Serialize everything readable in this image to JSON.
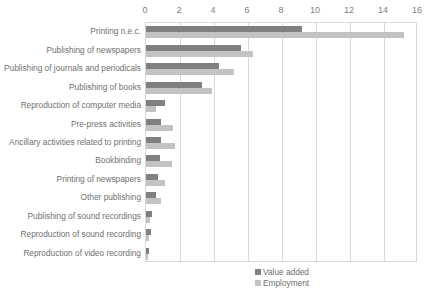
{
  "clipped_header_text": "",
  "legend": {
    "position": "bottom-center",
    "items": [
      {
        "label": "Value added",
        "color": "#808080"
      },
      {
        "label": "Employment",
        "color": "#c3c3c3"
      }
    ]
  },
  "chart_data": {
    "type": "bar",
    "orientation": "horizontal",
    "title": "",
    "subtitle": "",
    "xlabel": "",
    "ylabel": "",
    "xlim": [
      0,
      16
    ],
    "xticks": [
      0,
      2,
      4,
      6,
      8,
      10,
      12,
      14,
      16
    ],
    "xtick_labels": [
      "0",
      "2",
      "4",
      "6",
      "8",
      "10",
      "12",
      "14",
      "16"
    ],
    "grid": "vertical",
    "axis_label_position": "top",
    "categories": [
      "Printing n.e.c.",
      "Publishing of newspapers",
      "Publishing of journals and periodicals",
      "Publishing of books",
      "Reproduction of computer media",
      "Pre-press activities",
      "Ancillary activities related to printing",
      "Bookbinding",
      "Printing of newspapers",
      "Other publishing",
      "Publishing of sound recordings",
      "Reproduction of sound recording",
      "Reproduction of video recording"
    ],
    "series": [
      {
        "name": "Value added",
        "color": "#808080",
        "values": [
          9.2,
          5.6,
          4.3,
          3.3,
          1.1,
          0.9,
          0.9,
          0.8,
          0.7,
          0.6,
          0.35,
          0.3,
          0.15
        ]
      },
      {
        "name": "Employment",
        "color": "#c3c3c3",
        "values": [
          15.2,
          6.3,
          5.2,
          3.9,
          0.6,
          1.6,
          1.7,
          1.5,
          1.1,
          0.9,
          0.25,
          0.2,
          0.1
        ]
      }
    ]
  }
}
